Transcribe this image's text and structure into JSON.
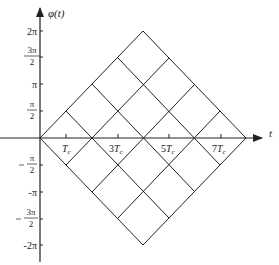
{
  "diagram": {
    "y_axis_label": "φ(t)",
    "x_axis_label": "t",
    "y_ticks": [
      {
        "value": "2π",
        "y": 31,
        "num": "2π",
        "den": ""
      },
      {
        "value": "3π/2",
        "y": 57,
        "num": "3π",
        "den": "2"
      },
      {
        "value": "π",
        "y": 84,
        "num": "π",
        "den": ""
      },
      {
        "value": "π/2",
        "y": 111,
        "num": "π",
        "den": "2"
      },
      {
        "value": "-π/2",
        "y": 165,
        "num": "π",
        "den": "2",
        "neg": true
      },
      {
        "value": "-π",
        "y": 192,
        "num": "-π",
        "den": ""
      },
      {
        "value": "-3π/2",
        "y": 219,
        "num": "3π",
        "den": "2",
        "neg": true
      },
      {
        "value": "-2π",
        "y": 245,
        "num": "-2π",
        "den": ""
      }
    ],
    "x_ticks": [
      {
        "label_coef": "",
        "label_sym": "T",
        "label_sub": "c",
        "x": 53
      },
      {
        "label_coef": "3",
        "label_sym": "T",
        "label_sub": "c",
        "x": 118
      },
      {
        "label_coef": "5",
        "label_sym": "T",
        "label_sub": "c",
        "x": 169
      },
      {
        "label_coef": "7",
        "label_sym": "T",
        "label_sub": "c",
        "x": 221
      }
    ],
    "labels": {
      "tick_Tc": "Tc",
      "tick_3Tc": "3Tc",
      "tick_5Tc": "5Tc",
      "tick_7Tc": "7Tc"
    },
    "geometry": {
      "origin": [
        40,
        138
      ],
      "tc_px": 12.9,
      "half_pi_px": 26.9,
      "max_phase": "2π",
      "max_time": "8Tc"
    },
    "line_color": "#222222"
  }
}
